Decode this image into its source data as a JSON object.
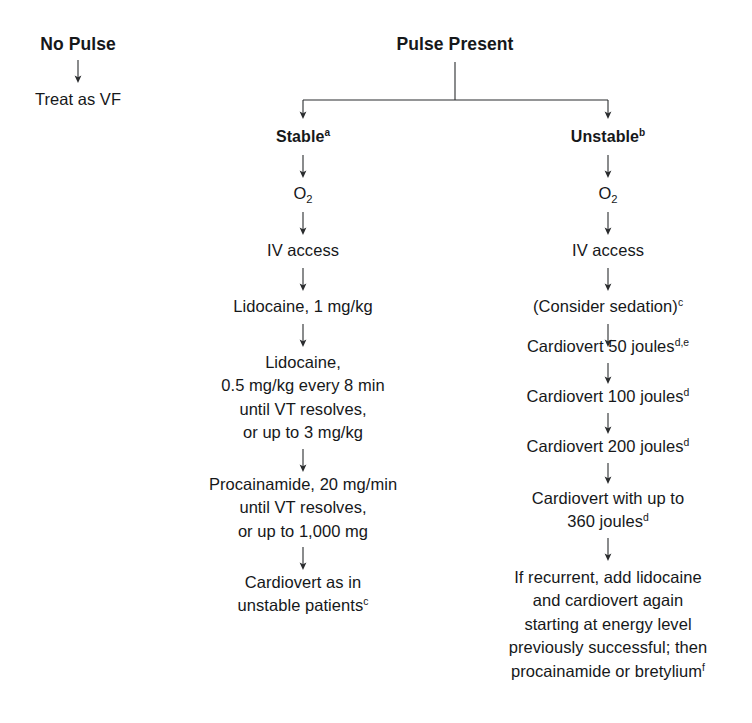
{
  "diagram": {
    "title_nopulse": "No Pulse",
    "nopulse_step": "Treat as VF",
    "title_pulse": "Pulse Present",
    "branch_stable": "Stable",
    "branch_stable_note": "a",
    "branch_unstable": "Unstable",
    "branch_unstable_note": "b",
    "stable": {
      "oxygen": "O",
      "oxygen_sub": "2",
      "iv_access": "IV access",
      "lidocaine_bolus": "Lidocaine, 1 mg/kg",
      "lidocaine_infusion_l1": "Lidocaine,",
      "lidocaine_infusion_l2": "0.5 mg/kg every 8 min",
      "lidocaine_infusion_l3": "until VT resolves,",
      "lidocaine_infusion_l4": "or up to 3 mg/kg",
      "procainamide_l1": "Procainamide, 20 mg/min",
      "procainamide_l2": "until VT resolves,",
      "procainamide_l3": "or up to 1,000 mg",
      "cardiovert_l1": "Cardiovert as in",
      "cardiovert_l2": "unstable patients",
      "cardiovert_note": "c"
    },
    "unstable": {
      "oxygen": "O",
      "oxygen_sub": "2",
      "iv_access": "IV access",
      "sedation": "(Consider sedation)",
      "sedation_note": "c",
      "cardiovert_50": "Cardiovert 50 joules",
      "cardiovert_50_note": "d,e",
      "cardiovert_100": "Cardiovert 100 joules",
      "cardiovert_100_note": "d",
      "cardiovert_200": "Cardiovert 200 joules",
      "cardiovert_200_note": "d",
      "cardiovert_360_l1": "Cardiovert with up to",
      "cardiovert_360_l2": "360 joules",
      "cardiovert_360_note": "d",
      "recurrent_l1": "If recurrent, add lidocaine",
      "recurrent_l2": "and cardiovert again",
      "recurrent_l3": "starting at energy level",
      "recurrent_l4": "previously successful; then",
      "recurrent_l5": "procainamide or bretylium",
      "recurrent_note": "f"
    }
  }
}
